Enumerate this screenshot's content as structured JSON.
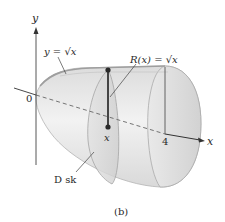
{
  "figure": {
    "caption": "(b)",
    "axes": {
      "y_label": "y",
      "x_label": "x",
      "origin_label": "0",
      "x_tick_label": "4"
    },
    "annotations": {
      "curve_label": "y = √x",
      "radius_label": "R(x) = √x",
      "point_label": "x",
      "disk_label": "D sk"
    },
    "colors": {
      "solid_fill": "#e6e6e6",
      "solid_edge": "#a9a9a9",
      "axis": "#333333",
      "radius_line": "#1e1e1e",
      "point": "#2a2a2a"
    }
  }
}
